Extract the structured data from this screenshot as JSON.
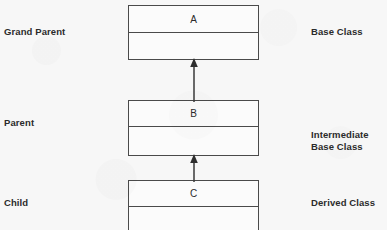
{
  "diagram": {
    "background_color": "#f7f7f7",
    "line_color": "#4a4a4a",
    "text_color": "#2b2b2b",
    "left_labels": [
      {
        "text": "Grand Parent",
        "x": 4,
        "y": 26
      },
      {
        "text": "Parent",
        "x": 4,
        "y": 117
      },
      {
        "text": "Child",
        "x": 4,
        "y": 197
      }
    ],
    "right_labels": [
      {
        "text": "Base Class",
        "x": 311,
        "y": 26
      },
      {
        "text": "Intermediate\nBase Class",
        "x": 311,
        "y": 129
      },
      {
        "text": "Derived Class",
        "x": 311,
        "y": 197
      }
    ],
    "classes": [
      {
        "name": "A",
        "role": "Grand Parent",
        "stereotype": "Base Class",
        "x": 128,
        "y": 5,
        "width": 131,
        "height": 55,
        "header_height": 27
      },
      {
        "name": "B",
        "role": "Parent",
        "stereotype": "Intermediate Base Class",
        "x": 128,
        "y": 100,
        "width": 131,
        "height": 56,
        "header_height": 26
      },
      {
        "name": "C",
        "role": "Child",
        "stereotype": "Derived Class",
        "x": 128,
        "y": 180,
        "width": 131,
        "height": 56,
        "header_height": 26
      }
    ],
    "relationships": [
      {
        "kind": "generalization",
        "from": "B",
        "to": "A",
        "x": 187,
        "y": 58,
        "width": 14,
        "height": 44,
        "label": "B inherits from A"
      },
      {
        "kind": "generalization",
        "from": "C",
        "to": "B",
        "x": 187,
        "y": 154,
        "width": 14,
        "height": 28,
        "label": "C inherits from B"
      }
    ]
  }
}
